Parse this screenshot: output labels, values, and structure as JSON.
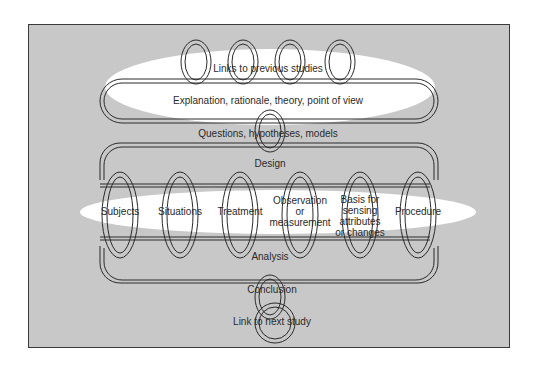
{
  "diagram": {
    "colors": {
      "background": "#c8c8c8",
      "glow": "#ffffff",
      "line": "#2a2a2a",
      "text": "#2a2a2a"
    },
    "top_glow_label": "Links to previous studies",
    "band1_label": "Explanation, rationale, theory, point of view",
    "link1_label": "Questions, hypotheses, models",
    "band2_label": "Design",
    "middle_items": [
      {
        "label": "Subjects"
      },
      {
        "label": "Situations"
      },
      {
        "label": "Treatment"
      },
      {
        "label": "Observation or measurement",
        "lines": [
          "Observation",
          "or",
          "measurement"
        ]
      },
      {
        "label": "Basis for sensing attributes or changes",
        "lines": [
          "Basis for",
          "sensing",
          "attributes",
          "or changes"
        ]
      },
      {
        "label": "Procedure"
      }
    ],
    "band3_label": "Analysis",
    "conclusion_label": "Conclusion",
    "next_label": "Link to next study"
  }
}
